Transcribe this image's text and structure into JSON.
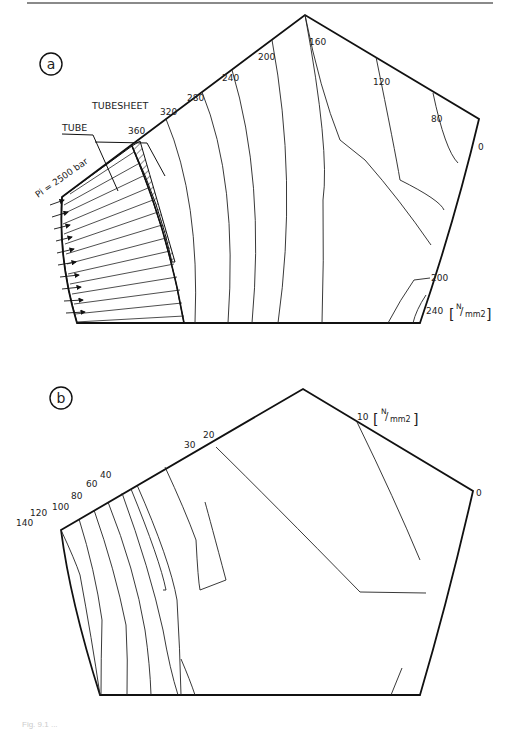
{
  "figure": {
    "panel_a": {
      "label": "a",
      "region_labels": {
        "tubesheet": "TUBESHEET",
        "tube": "TUBE"
      },
      "pressure_label": "Pi = 2500 bar",
      "unit": "[N/mm2]",
      "unit_parts": {
        "num": "N",
        "den": "mm2"
      },
      "contour_values_top": [
        "360",
        "320",
        "280",
        "240",
        "200",
        "160",
        "120",
        "80",
        "0"
      ],
      "contour_values_right": [
        "200",
        "240"
      ]
    },
    "panel_b": {
      "label": "b",
      "unit": "[N/mm2]",
      "unit_parts": {
        "num": "N",
        "den": "mm2"
      },
      "contour_values_top": [
        "140",
        "120",
        "100",
        "80",
        "60",
        "40",
        "30",
        "20",
        "10",
        "0"
      ]
    },
    "caption": "Fig. 9.1 ..."
  }
}
